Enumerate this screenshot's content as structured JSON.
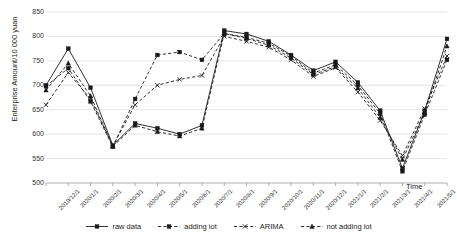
{
  "chart_data": {
    "type": "line",
    "title": "",
    "xlabel": "Time",
    "ylabel": "Enterprise Amount/10 000 yuan",
    "ylim": [
      500,
      850
    ],
    "ytick_step": 50,
    "yticks": [
      500,
      550,
      600,
      650,
      700,
      750,
      800,
      850
    ],
    "grid": true,
    "legend_position": "bottom",
    "categories": [
      "2019/12/1",
      "2020/1/1",
      "2020/2/1",
      "2020/3/1",
      "2020/4/1",
      "2020/5/1",
      "2020/6/1",
      "2020/7/1",
      "2020/8/1",
      "2020/9/1",
      "2020/10/1",
      "2020/11/1",
      "2020/12/1",
      "2021/1/1",
      "2021/2/1",
      "2021/3/1",
      "2021/4/1",
      "2021/5/1",
      "2021/6/1"
    ],
    "series": [
      {
        "name": "raw data",
        "style": "solid",
        "marker": "square",
        "color": "#1a1a1a",
        "values": [
          700,
          775,
          695,
          577,
          622,
          612,
          600,
          618,
          812,
          805,
          790,
          762,
          730,
          748,
          706,
          648,
          530,
          648,
          795
        ]
      },
      {
        "name": "adding iot",
        "style": "dashed",
        "marker": "square",
        "color": "#1a1a1a",
        "values": [
          698,
          735,
          667,
          574,
          672,
          762,
          768,
          752,
          806,
          798,
          786,
          760,
          725,
          742,
          700,
          642,
          524,
          640,
          752
        ]
      },
      {
        "name": "ARIMA",
        "style": "dashed",
        "marker": "cross",
        "color": "#1a1a1a",
        "values": [
          660,
          726,
          672,
          576,
          660,
          700,
          712,
          720,
          800,
          790,
          778,
          752,
          718,
          736,
          686,
          628,
          556,
          652,
          760
        ]
      },
      {
        "name": "not adding iot",
        "style": "dashed",
        "marker": "triangle",
        "color": "#1a1a1a",
        "values": [
          690,
          745,
          678,
          575,
          618,
          605,
          596,
          612,
          806,
          796,
          782,
          756,
          722,
          738,
          694,
          634,
          548,
          644,
          780
        ]
      }
    ]
  },
  "legend": {
    "items": [
      {
        "label": "raw data"
      },
      {
        "label": "adding iot"
      },
      {
        "label": "ARIMA"
      },
      {
        "label": "not adding iot"
      }
    ]
  }
}
